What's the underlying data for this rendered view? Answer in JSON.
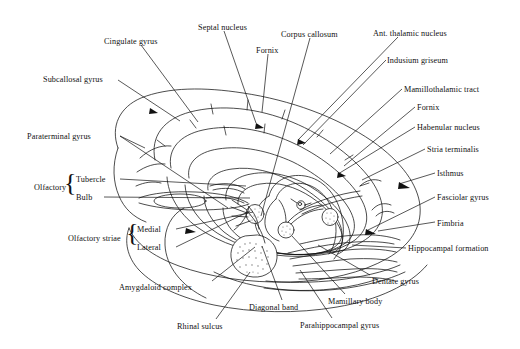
{
  "figure": {
    "type": "anatomical-line-drawing",
    "background_color": "#ffffff",
    "ink_color": "#111111",
    "stipple_color": "#6b6b6b"
  },
  "labels": [
    {
      "id": "cingulate-gyrus",
      "text": "Cingulate gyrus",
      "x": 104,
      "y": 38,
      "anchor": "start"
    },
    {
      "id": "septal-nucleus",
      "text": "Septal nucleus",
      "x": 198,
      "y": 24,
      "anchor": "start"
    },
    {
      "id": "corpus-callosum",
      "text": "Corpus callosum",
      "x": 281,
      "y": 31,
      "anchor": "start"
    },
    {
      "id": "ant-thalamic-nucleus",
      "text": "Ant. thalamic nucleus",
      "x": 373,
      "y": 30,
      "anchor": "start"
    },
    {
      "id": "fornix-top",
      "text": "Fornix",
      "x": 256,
      "y": 47,
      "anchor": "start"
    },
    {
      "id": "indusium-griseum",
      "text": "Indusium  griseum",
      "x": 387,
      "y": 57,
      "anchor": "start"
    },
    {
      "id": "subcallosal-gyrus",
      "text": "Subcallosal gyrus",
      "x": 43,
      "y": 76,
      "anchor": "start"
    },
    {
      "id": "mamillothalamic-tract",
      "text": "Mamillothalamic tract",
      "x": 404,
      "y": 86,
      "anchor": "start"
    },
    {
      "id": "fornix-right",
      "text": "Fornix",
      "x": 417,
      "y": 104,
      "anchor": "start"
    },
    {
      "id": "paraterminal-gyrus",
      "text": "Paraterminal gyrus",
      "x": 27,
      "y": 133,
      "anchor": "start"
    },
    {
      "id": "habenular-nucleus",
      "text": "Habenular nucleus",
      "x": 417,
      "y": 124,
      "anchor": "start"
    },
    {
      "id": "stria-terminalis",
      "text": "Stria terminalis",
      "x": 427,
      "y": 146,
      "anchor": "start"
    },
    {
      "id": "isthmus",
      "text": "Isthmus",
      "x": 437,
      "y": 170,
      "anchor": "start"
    },
    {
      "id": "olfactory-group",
      "text": "Olfactory",
      "x": 34,
      "y": 184,
      "anchor": "start"
    },
    {
      "id": "tubercle",
      "text": "Tubercle",
      "x": 76,
      "y": 176,
      "anchor": "start"
    },
    {
      "id": "bulb",
      "text": "Bulb",
      "x": 76,
      "y": 194,
      "anchor": "start"
    },
    {
      "id": "fasciolar-gyrus",
      "text": "Fasciolar gyrus",
      "x": 437,
      "y": 194,
      "anchor": "start"
    },
    {
      "id": "fimbria",
      "text": "Fimbria",
      "x": 437,
      "y": 220,
      "anchor": "start"
    },
    {
      "id": "olfactory-striae-group",
      "text": "Olfactory striae",
      "x": 68,
      "y": 235,
      "anchor": "start"
    },
    {
      "id": "medial",
      "text": "Medial",
      "x": 137,
      "y": 226,
      "anchor": "start"
    },
    {
      "id": "lateral",
      "text": "Lateral",
      "x": 137,
      "y": 244,
      "anchor": "start"
    },
    {
      "id": "hippocampal-formation",
      "text": "Hippocampal formation",
      "x": 408,
      "y": 245,
      "anchor": "start"
    },
    {
      "id": "amygdaloid-complex",
      "text": "Amygdaloid complex",
      "x": 119,
      "y": 284,
      "anchor": "start"
    },
    {
      "id": "dentate-gyrus",
      "text": "Dentate gyrus",
      "x": 372,
      "y": 278,
      "anchor": "start"
    },
    {
      "id": "mamillary-body",
      "text": "Mamillary body",
      "x": 328,
      "y": 298,
      "anchor": "start"
    },
    {
      "id": "diagonal-band",
      "text": "Diagonal band",
      "x": 249,
      "y": 304,
      "anchor": "start"
    },
    {
      "id": "rhinal-sulcus",
      "text": "Rhinal sulcus",
      "x": 177,
      "y": 323,
      "anchor": "start"
    },
    {
      "id": "parahippocampal-gyrus",
      "text": "Parahippocampal gyrus",
      "x": 300,
      "y": 322,
      "anchor": "start"
    }
  ],
  "braces": [
    {
      "id": "olfactory-brace",
      "glyph": "{",
      "x": 64,
      "y": 170,
      "size": 26
    },
    {
      "id": "olfactory-striae-brace",
      "glyph": "{",
      "x": 126,
      "y": 220,
      "size": 26
    }
  ],
  "structures": [
    "cingulate gyrus ring",
    "corpus callosum arc",
    "fornix arch",
    "septal nucleus",
    "anterior thalamic nucleus",
    "habenular nucleus",
    "mamillary body",
    "amygdaloid complex",
    "olfactory bulb and tract",
    "hippocampal formation",
    "dentate gyrus",
    "fimbria",
    "parahippocampal gyrus",
    "rhinal sulcus"
  ]
}
